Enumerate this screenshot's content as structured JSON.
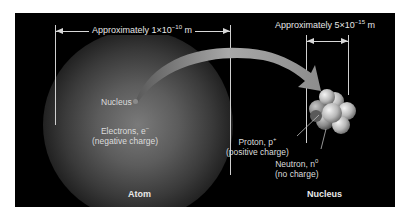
{
  "diagram": {
    "atom_dimension": {
      "prefix": "Approximately 1×10",
      "exponent": "−10",
      "unit": " m"
    },
    "nucleus_dimension": {
      "prefix": "Approximately 5×10",
      "exponent": "−15",
      "unit": " m"
    },
    "labels": {
      "nucleus_point": "Nucleus",
      "electrons_line1": "Electrons, e",
      "electrons_sup": "−",
      "electrons_line2": "(negative charge)",
      "proton_line1": "Proton, p",
      "proton_sup": "+",
      "proton_line2": "(positive charge)",
      "neutron_line1": "Neutron, n",
      "neutron_sup": "0",
      "neutron_line2": "(no charge)"
    },
    "captions": {
      "atom": "Atom",
      "nucleus": "Nucleus"
    },
    "colors": {
      "background": "#000000",
      "text": "#e6e6e6",
      "arrow": "#a9a9a9"
    }
  }
}
